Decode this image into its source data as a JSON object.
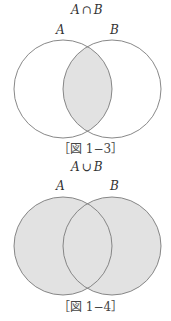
{
  "figures": [
    {
      "title_left": "A",
      "title_op": "∩",
      "title_right": "B",
      "label_a": "A",
      "label_b": "B",
      "caption": "［図 1−3］",
      "shading": "intersection",
      "fill_color": "#e2e2e2",
      "stroke_color": "#7a7a7a"
    },
    {
      "title_left": "A",
      "title_op": "∪",
      "title_right": "B",
      "label_a": "A",
      "label_b": "B",
      "caption": "［図 1−4］",
      "shading": "union",
      "fill_color": "#e2e2e2",
      "stroke_color": "#7a7a7a"
    }
  ]
}
